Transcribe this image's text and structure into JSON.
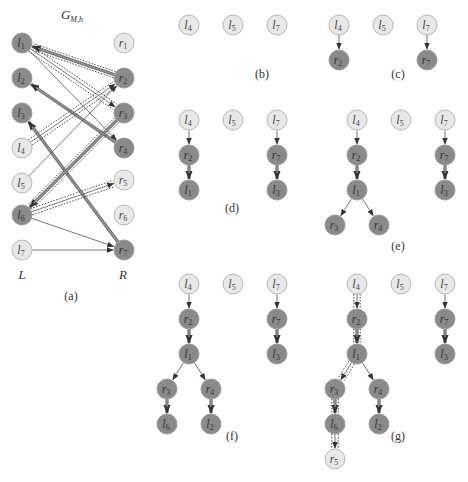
{
  "figure": {
    "panel_a": {
      "title": "G",
      "title_sub": "M,h",
      "left_label": "L",
      "right_label": "R",
      "caption": "(a)",
      "left_nodes": [
        {
          "id": "l1",
          "base": "l",
          "sub": "1",
          "shade": "dark"
        },
        {
          "id": "l2",
          "base": "l",
          "sub": "2",
          "shade": "dark"
        },
        {
          "id": "l3",
          "base": "l",
          "sub": "3",
          "shade": "dark"
        },
        {
          "id": "l4",
          "base": "l",
          "sub": "4",
          "shade": "light"
        },
        {
          "id": "l5",
          "base": "l",
          "sub": "5",
          "shade": "light"
        },
        {
          "id": "l6",
          "base": "l",
          "sub": "6",
          "shade": "dark"
        },
        {
          "id": "l7",
          "base": "l",
          "sub": "7",
          "shade": "light"
        }
      ],
      "right_nodes": [
        {
          "id": "r1",
          "base": "r",
          "sub": "1",
          "shade": "light"
        },
        {
          "id": "r2",
          "base": "r",
          "sub": "2",
          "shade": "dark"
        },
        {
          "id": "r3",
          "base": "r",
          "sub": "3",
          "shade": "dark"
        },
        {
          "id": "r4",
          "base": "r",
          "sub": "4",
          "shade": "dark"
        },
        {
          "id": "r5",
          "base": "r",
          "sub": "5",
          "shade": "light"
        },
        {
          "id": "r6",
          "base": "r",
          "sub": "6",
          "shade": "light"
        },
        {
          "id": "r7",
          "base": "r",
          "sub": "7",
          "shade": "dark"
        }
      ],
      "edges": [
        {
          "from": "r2",
          "to": "l1",
          "style": "matched",
          "path": true
        },
        {
          "from": "l1",
          "to": "r3",
          "style": "thin",
          "path": true
        },
        {
          "from": "l1",
          "to": "r4",
          "style": "thin",
          "path": false
        },
        {
          "from": "r4",
          "to": "l2",
          "style": "matched",
          "path": false
        },
        {
          "from": "r7",
          "to": "l3",
          "style": "matched",
          "path": false
        },
        {
          "from": "l4",
          "to": "r2",
          "style": "thin",
          "path": true
        },
        {
          "from": "l5",
          "to": "r2",
          "style": "thin",
          "path": false
        },
        {
          "from": "r3",
          "to": "l6",
          "style": "matched",
          "path": true
        },
        {
          "from": "l6",
          "to": "r5",
          "style": "thin",
          "path": true
        },
        {
          "from": "l6",
          "to": "r7",
          "style": "thin",
          "path": false
        },
        {
          "from": "l7",
          "to": "r7",
          "style": "thin",
          "path": false
        }
      ]
    },
    "panels": [
      {
        "caption": "(b)",
        "nodes": [
          {
            "id": "l4",
            "base": "l",
            "sub": "4",
            "shade": "light",
            "col": 0,
            "row": 0
          },
          {
            "id": "l5",
            "base": "l",
            "sub": "5",
            "shade": "light",
            "col": 1,
            "row": 0
          },
          {
            "id": "l7",
            "base": "l",
            "sub": "7",
            "shade": "light",
            "col": 2,
            "row": 0
          }
        ],
        "edges": []
      },
      {
        "caption": "(c)",
        "nodes": [
          {
            "id": "l4",
            "base": "l",
            "sub": "4",
            "shade": "light",
            "col": 0,
            "row": 0
          },
          {
            "id": "l5",
            "base": "l",
            "sub": "5",
            "shade": "light",
            "col": 1,
            "row": 0
          },
          {
            "id": "l7",
            "base": "l",
            "sub": "7",
            "shade": "light",
            "col": 2,
            "row": 0
          },
          {
            "id": "r2",
            "base": "r",
            "sub": "2",
            "shade": "dark",
            "col": 0,
            "row": 1
          },
          {
            "id": "r7",
            "base": "r",
            "sub": "7",
            "shade": "dark",
            "col": 2,
            "row": 1
          }
        ],
        "edges": [
          {
            "from": "l4",
            "to": "r2",
            "style": "thin",
            "path": false
          },
          {
            "from": "l7",
            "to": "r7",
            "style": "thin",
            "path": false
          }
        ]
      },
      {
        "caption": "(d)",
        "nodes": [
          {
            "id": "l4",
            "base": "l",
            "sub": "4",
            "shade": "light",
            "col": 0,
            "row": 0
          },
          {
            "id": "l5",
            "base": "l",
            "sub": "5",
            "shade": "light",
            "col": 1,
            "row": 0
          },
          {
            "id": "l7",
            "base": "l",
            "sub": "7",
            "shade": "light",
            "col": 2,
            "row": 0
          },
          {
            "id": "r2",
            "base": "r",
            "sub": "2",
            "shade": "dark",
            "col": 0,
            "row": 1
          },
          {
            "id": "r7",
            "base": "r",
            "sub": "7",
            "shade": "dark",
            "col": 2,
            "row": 1
          },
          {
            "id": "l1",
            "base": "l",
            "sub": "1",
            "shade": "dark",
            "col": 0,
            "row": 2
          },
          {
            "id": "l3",
            "base": "l",
            "sub": "3",
            "shade": "dark",
            "col": 2,
            "row": 2
          }
        ],
        "edges": [
          {
            "from": "l4",
            "to": "r2",
            "style": "thin",
            "path": false
          },
          {
            "from": "l7",
            "to": "r7",
            "style": "thin",
            "path": false
          },
          {
            "from": "r2",
            "to": "l1",
            "style": "matched",
            "path": false
          },
          {
            "from": "r7",
            "to": "l3",
            "style": "matched",
            "path": false
          }
        ]
      },
      {
        "caption": "(e)",
        "nodes": [
          {
            "id": "l4",
            "base": "l",
            "sub": "4",
            "shade": "light",
            "col": 0,
            "row": 0
          },
          {
            "id": "l5",
            "base": "l",
            "sub": "5",
            "shade": "light",
            "col": 1,
            "row": 0
          },
          {
            "id": "l7",
            "base": "l",
            "sub": "7",
            "shade": "light",
            "col": 2,
            "row": 0
          },
          {
            "id": "r2",
            "base": "r",
            "sub": "2",
            "shade": "dark",
            "col": 0,
            "row": 1
          },
          {
            "id": "r7",
            "base": "r",
            "sub": "7",
            "shade": "dark",
            "col": 2,
            "row": 1
          },
          {
            "id": "l1",
            "base": "l",
            "sub": "1",
            "shade": "dark",
            "col": 0,
            "row": 2
          },
          {
            "id": "l3",
            "base": "l",
            "sub": "3",
            "shade": "dark",
            "col": 2,
            "row": 2
          },
          {
            "id": "r3",
            "base": "r",
            "sub": "3",
            "shade": "dark",
            "col": -0.5,
            "row": 3
          },
          {
            "id": "r4",
            "base": "r",
            "sub": "4",
            "shade": "dark",
            "col": 0.5,
            "row": 3
          }
        ],
        "edges": [
          {
            "from": "l4",
            "to": "r2",
            "style": "thin",
            "path": false
          },
          {
            "from": "l7",
            "to": "r7",
            "style": "thin",
            "path": false
          },
          {
            "from": "r2",
            "to": "l1",
            "style": "matched",
            "path": false
          },
          {
            "from": "r7",
            "to": "l3",
            "style": "matched",
            "path": false
          },
          {
            "from": "l1",
            "to": "r3",
            "style": "thin",
            "path": false
          },
          {
            "from": "l1",
            "to": "r4",
            "style": "thin",
            "path": false
          }
        ]
      },
      {
        "caption": "(f)",
        "nodes": [
          {
            "id": "l4",
            "base": "l",
            "sub": "4",
            "shade": "light",
            "col": 0,
            "row": 0
          },
          {
            "id": "l5",
            "base": "l",
            "sub": "5",
            "shade": "light",
            "col": 1,
            "row": 0
          },
          {
            "id": "l7",
            "base": "l",
            "sub": "7",
            "shade": "light",
            "col": 2,
            "row": 0
          },
          {
            "id": "r2",
            "base": "r",
            "sub": "2",
            "shade": "dark",
            "col": 0,
            "row": 1
          },
          {
            "id": "r7",
            "base": "r",
            "sub": "7",
            "shade": "dark",
            "col": 2,
            "row": 1
          },
          {
            "id": "l1",
            "base": "l",
            "sub": "1",
            "shade": "dark",
            "col": 0,
            "row": 2
          },
          {
            "id": "l3",
            "base": "l",
            "sub": "3",
            "shade": "dark",
            "col": 2,
            "row": 2
          },
          {
            "id": "r3",
            "base": "r",
            "sub": "3",
            "shade": "dark",
            "col": -0.5,
            "row": 3
          },
          {
            "id": "r4",
            "base": "r",
            "sub": "4",
            "shade": "dark",
            "col": 0.5,
            "row": 3
          },
          {
            "id": "l6",
            "base": "l",
            "sub": "6",
            "shade": "dark",
            "col": -0.5,
            "row": 4
          },
          {
            "id": "l2",
            "base": "l",
            "sub": "2",
            "shade": "dark",
            "col": 0.5,
            "row": 4
          }
        ],
        "edges": [
          {
            "from": "l4",
            "to": "r2",
            "style": "thin",
            "path": false
          },
          {
            "from": "l7",
            "to": "r7",
            "style": "thin",
            "path": false
          },
          {
            "from": "r2",
            "to": "l1",
            "style": "matched",
            "path": false
          },
          {
            "from": "r7",
            "to": "l3",
            "style": "matched",
            "path": false
          },
          {
            "from": "l1",
            "to": "r3",
            "style": "thin",
            "path": false
          },
          {
            "from": "l1",
            "to": "r4",
            "style": "thin",
            "path": false
          },
          {
            "from": "r3",
            "to": "l6",
            "style": "matched",
            "path": false
          },
          {
            "from": "r4",
            "to": "l2",
            "style": "matched",
            "path": false
          }
        ]
      },
      {
        "caption": "(g)",
        "nodes": [
          {
            "id": "l4",
            "base": "l",
            "sub": "4",
            "shade": "light",
            "col": 0,
            "row": 0
          },
          {
            "id": "l5",
            "base": "l",
            "sub": "5",
            "shade": "light",
            "col": 1,
            "row": 0
          },
          {
            "id": "l7",
            "base": "l",
            "sub": "7",
            "shade": "light",
            "col": 2,
            "row": 0
          },
          {
            "id": "r2",
            "base": "r",
            "sub": "2",
            "shade": "dark",
            "col": 0,
            "row": 1
          },
          {
            "id": "r7",
            "base": "r",
            "sub": "7",
            "shade": "dark",
            "col": 2,
            "row": 1
          },
          {
            "id": "l1",
            "base": "l",
            "sub": "1",
            "shade": "dark",
            "col": 0,
            "row": 2
          },
          {
            "id": "l3",
            "base": "l",
            "sub": "3",
            "shade": "dark",
            "col": 2,
            "row": 2
          },
          {
            "id": "r3",
            "base": "r",
            "sub": "3",
            "shade": "dark",
            "col": -0.5,
            "row": 3
          },
          {
            "id": "r4",
            "base": "r",
            "sub": "4",
            "shade": "dark",
            "col": 0.5,
            "row": 3
          },
          {
            "id": "l6",
            "base": "l",
            "sub": "6",
            "shade": "dark",
            "col": -0.5,
            "row": 4
          },
          {
            "id": "l2",
            "base": "l",
            "sub": "2",
            "shade": "dark",
            "col": 0.5,
            "row": 4
          },
          {
            "id": "r5",
            "base": "r",
            "sub": "5",
            "shade": "light",
            "col": -0.5,
            "row": 5
          }
        ],
        "edges": [
          {
            "from": "l4",
            "to": "r2",
            "style": "thin",
            "path": true
          },
          {
            "from": "l7",
            "to": "r7",
            "style": "thin",
            "path": false
          },
          {
            "from": "r2",
            "to": "l1",
            "style": "matched",
            "path": true
          },
          {
            "from": "r7",
            "to": "l3",
            "style": "matched",
            "path": false
          },
          {
            "from": "l1",
            "to": "r3",
            "style": "thin",
            "path": true
          },
          {
            "from": "l1",
            "to": "r4",
            "style": "thin",
            "path": false
          },
          {
            "from": "r3",
            "to": "l6",
            "style": "matched",
            "path": true
          },
          {
            "from": "r4",
            "to": "l2",
            "style": "matched",
            "path": false
          },
          {
            "from": "l6",
            "to": "r5",
            "style": "thin",
            "path": true
          }
        ]
      }
    ]
  }
}
